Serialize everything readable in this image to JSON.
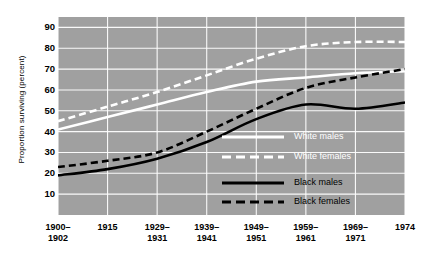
{
  "figure": {
    "background": "#ffffff",
    "plot_background": "#a0a0a0",
    "white_color": "#ffffff",
    "black_color": "#000000"
  },
  "axes": {
    "ylabel": "Proportion surviving (percent)",
    "yticks": [
      "90",
      "80",
      "70",
      "60",
      "50",
      "40",
      "30",
      "20",
      "10"
    ],
    "ylim": [
      0,
      95
    ],
    "xticks": [
      {
        "label": "1900–\n1902",
        "value": 0
      },
      {
        "label": "1915",
        "value": 1
      },
      {
        "label": "1929–\n1931",
        "value": 2
      },
      {
        "label": "1939–\n1941",
        "value": 3
      },
      {
        "label": "1949–\n1951",
        "value": 4
      },
      {
        "label": "1959–\n1961",
        "value": 5
      },
      {
        "label": "1969–\n1971",
        "value": 6
      },
      {
        "label": "1974",
        "value": 7
      }
    ]
  },
  "legend": {
    "items": [
      {
        "label": "White males",
        "color": "#ffffff",
        "style": "solid"
      },
      {
        "label": "White females",
        "color": "#ffffff",
        "style": "dashed"
      },
      {
        "label": "Black males",
        "color": "#000000",
        "style": "solid"
      },
      {
        "label": "Black females",
        "color": "#000000",
        "style": "dashed"
      }
    ]
  },
  "chart_data": {
    "type": "line",
    "title": "",
    "xlabel": "",
    "ylabel": "Proportion surviving (percent)",
    "ylim": [
      0,
      95
    ],
    "grid": true,
    "legend_position": "center-right",
    "categories": [
      "1900–1902",
      "1915",
      "1929–1931",
      "1939–1941",
      "1949–1951",
      "1959–1961",
      "1969–1971",
      "1974"
    ],
    "series": [
      {
        "name": "White males",
        "color": "#ffffff",
        "style": "solid",
        "values": [
          41,
          47,
          53,
          59,
          64,
          66,
          68,
          69
        ]
      },
      {
        "name": "White females",
        "color": "#ffffff",
        "style": "dashed",
        "values": [
          45,
          52,
          59,
          67,
          75,
          81,
          83,
          83
        ]
      },
      {
        "name": "Black males",
        "color": "#000000",
        "style": "solid",
        "values": [
          19,
          22,
          27,
          35,
          46,
          53,
          51,
          54
        ]
      },
      {
        "name": "Black females",
        "color": "#000000",
        "style": "dashed",
        "values": [
          23,
          26,
          30,
          40,
          51,
          61,
          66,
          70
        ]
      }
    ]
  }
}
